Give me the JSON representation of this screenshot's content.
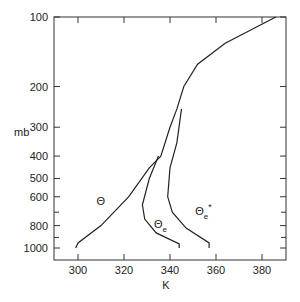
{
  "chart_data": {
    "type": "line",
    "title": "",
    "xlabel": "K",
    "ylabel": "mb",
    "xlim": [
      290,
      390
    ],
    "ylim": [
      1050,
      100
    ],
    "y_scale": "log (pressure)",
    "x_ticks": [
      "300",
      "320",
      "340",
      "360",
      "380"
    ],
    "y_ticks": [
      "100",
      "200",
      "300",
      "400",
      "500",
      "600",
      "800",
      "1000"
    ],
    "y_minor_ticks": [
      700,
      900
    ],
    "series": [
      {
        "name": "Θ",
        "points": [
          [
            299,
            1000
          ],
          [
            300,
            950
          ],
          [
            310,
            800
          ],
          [
            322,
            600
          ],
          [
            331,
            450
          ],
          [
            336,
            400
          ],
          [
            340,
            300
          ],
          [
            343,
            250
          ],
          [
            346,
            200
          ],
          [
            352,
            160
          ],
          [
            364,
            130
          ],
          [
            386,
            100
          ]
        ]
      },
      {
        "name": "Θe",
        "points": [
          [
            344,
            1000
          ],
          [
            344,
            960
          ],
          [
            334,
            860
          ],
          [
            329,
            750
          ],
          [
            328,
            650
          ],
          [
            331,
            500
          ],
          [
            335,
            400
          ]
        ]
      },
      {
        "name": "Θe*",
        "points": [
          [
            357,
            1000
          ],
          [
            357,
            950
          ],
          [
            347,
            820
          ],
          [
            341,
            700
          ],
          [
            339,
            600
          ],
          [
            340,
            450
          ],
          [
            343,
            350
          ],
          [
            345,
            250
          ]
        ]
      }
    ],
    "annotations": [
      {
        "text": "Θ",
        "x": 308,
        "y": 650
      },
      {
        "text": "Θe",
        "x": 333,
        "y": 820
      },
      {
        "text": "Θe*",
        "x": 351,
        "y": 720
      }
    ],
    "grid": false,
    "legend": "inline labels"
  }
}
